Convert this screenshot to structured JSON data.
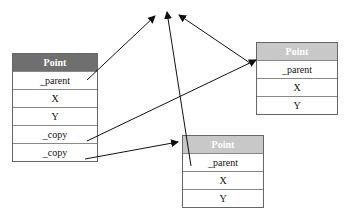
{
  "boxes": {
    "left": {
      "title": "Point",
      "header_color": "#6f6f6f",
      "fields": [
        "_parent",
        "X",
        "Y",
        "_copy",
        "_copy"
      ]
    },
    "right": {
      "title": "Point",
      "header_color": "#c8c8c8",
      "fields": [
        "_parent",
        "X",
        "Y"
      ]
    },
    "bottom": {
      "title": "Point",
      "header_color": "#c8c8c8",
      "fields": [
        "_parent",
        "X",
        "Y"
      ]
    }
  }
}
